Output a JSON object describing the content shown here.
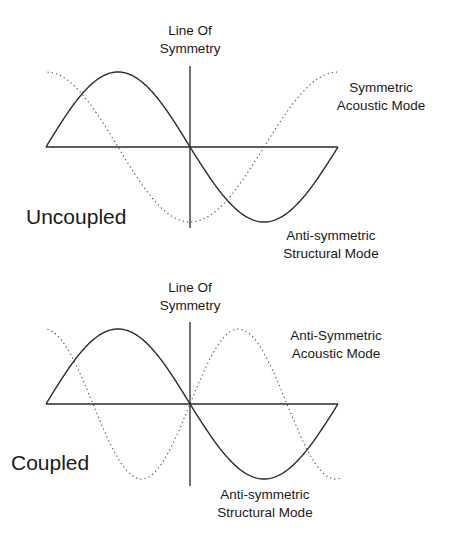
{
  "chart_data": [
    {
      "type": "line",
      "title": "Uncoupled",
      "symmetry_line_label": [
        "Line Of",
        "Symmetry"
      ],
      "axis": {
        "x_start": 46,
        "x_end": 338,
        "y": 147
      },
      "symmetry_line": {
        "x": 190,
        "y_top": 66,
        "y_bottom": 228
      },
      "series": [
        {
          "name": "Anti-symmetric Structural Mode",
          "style": "solid",
          "function": "sin",
          "amplitude": 75,
          "x_start": 46,
          "x_end": 338,
          "zero_crossings": [
            46,
            190,
            338
          ],
          "peak": [
            110,
            72
          ],
          "trough": [
            272,
            222
          ]
        },
        {
          "name": "Symmetric Acoustic Mode",
          "style": "dotted",
          "function": "cos",
          "amplitude": 75,
          "x_start": 46,
          "x_end": 338,
          "peaks": [
            [
              48,
              72
            ],
            [
              338,
              72
            ]
          ],
          "trough": [
            190,
            222
          ]
        }
      ],
      "labels": {
        "acoustic": [
          "Symmetric",
          "Acoustic Mode"
        ],
        "structural": [
          "Anti-symmetric",
          "Structural Mode"
        ],
        "state": "Uncoupled"
      }
    },
    {
      "type": "line",
      "title": "Coupled",
      "symmetry_line_label": [
        "Line Of",
        "Symmetry"
      ],
      "axis": {
        "x_start": 46,
        "x_end": 338,
        "y": 404
      },
      "symmetry_line": {
        "x": 190,
        "y_top": 322,
        "y_bottom": 486
      },
      "series": [
        {
          "name": "Anti-symmetric Structural Mode",
          "style": "solid",
          "function": "sin",
          "amplitude": 75,
          "x_start": 46,
          "x_end": 338,
          "zero_crossings": [
            46,
            190,
            338
          ],
          "peak": [
            118,
            329
          ],
          "trough": [
            265,
            479
          ]
        },
        {
          "name": "Anti-Symmetric Acoustic Mode",
          "style": "dotted",
          "function": "cos",
          "amplitude": 75,
          "x_start": 48,
          "x_end": 338,
          "zero_crossings": [
            94,
            190,
            288
          ],
          "peaks": [
            [
              48,
              328
            ],
            [
              238,
              330
            ]
          ],
          "troughs": [
            [
              142,
              478
            ],
            [
              338,
              480
            ]
          ]
        }
      ],
      "labels": {
        "acoustic": [
          "Anti-Symmetric",
          "Acoustic Mode"
        ],
        "structural": [
          "Anti-symmetric",
          "Structural Mode"
        ],
        "state": "Coupled"
      }
    }
  ],
  "top": {
    "symmetry_line_1": "Line Of",
    "symmetry_line_2": "Symmetry",
    "acoustic_1": "Symmetric",
    "acoustic_2": "Acoustic Mode",
    "structural_1": "Anti-symmetric",
    "structural_2": "Structural Mode",
    "state": "Uncoupled"
  },
  "bottom": {
    "symmetry_line_1": "Line Of",
    "symmetry_line_2": "Symmetry",
    "acoustic_1": "Anti-Symmetric",
    "acoustic_2": "Acoustic Mode",
    "structural_1": "Anti-symmetric",
    "structural_2": "Structural Mode",
    "state": "Coupled"
  }
}
